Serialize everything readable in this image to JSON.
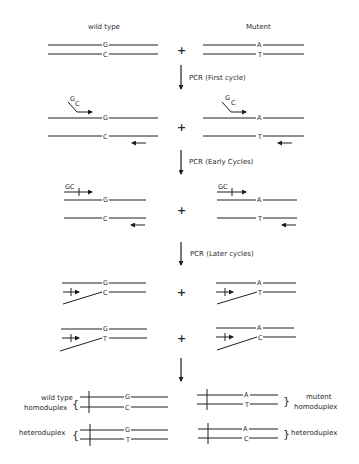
{
  "headers": {
    "left": "wild type",
    "right": "Mutent"
  },
  "plus": "+",
  "steps": [
    {
      "label": "PCR (First cycle)"
    },
    {
      "label": "PCR (Early Cycles)"
    },
    {
      "label": "PCR (Later cycles)"
    }
  ],
  "row1": {
    "wt_top": "G",
    "wt_bottom": "C",
    "mut_top": "A",
    "mut_bottom": "T"
  },
  "row2": {
    "wt_primer_tail_top": "G",
    "wt_primer_tail_bottom": "C",
    "mut_primer_tail_top": "G",
    "mut_primer_tail_bottom": "C",
    "wt_top": "G",
    "wt_bottom": "C",
    "mut_top": "A",
    "mut_bottom": "T"
  },
  "row3": {
    "wt_gc": "GC",
    "mut_gc": "GC",
    "wt_top": "G",
    "wt_bottom": "C",
    "mut_top": "A",
    "mut_bottom": "T"
  },
  "row4": {
    "wt_top": "G",
    "wt_bottom": "C",
    "mut_top": "A",
    "mut_bottom": "T"
  },
  "row5": {
    "wt_top": "G",
    "wt_bottom": "T",
    "mut_top": "A",
    "mut_bottom": "C"
  },
  "results": {
    "wt_homo": {
      "label_line1": "wild type",
      "label_line2": "homoduplex",
      "top": "G",
      "bottom": "C"
    },
    "mut_homo": {
      "label_line1": "mutent",
      "label_line2": "homoduplex",
      "top": "A",
      "bottom": "T"
    },
    "wt_hetero": {
      "label": "heteroduplex",
      "top": "G",
      "bottom": "T"
    },
    "mut_hetero": {
      "label": "heteroduplex",
      "top": "A",
      "bottom": "C"
    },
    "brace_left": "{",
    "brace_right": "}"
  }
}
